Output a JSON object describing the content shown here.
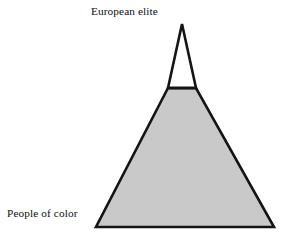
{
  "diagram": {
    "background_color": "#ffffff",
    "stroke_color": "#141414",
    "labels": {
      "top": "European elite",
      "bottom": "People of color"
    },
    "segments": [
      {
        "name": "european-elite-apex",
        "label": "European elite",
        "fill_color": "#ffffff",
        "shape": "triangle",
        "position": "top"
      },
      {
        "name": "people-of-color-base",
        "label": "People of color",
        "fill_color": "#c9c9c9",
        "shape": "trapezoid",
        "position": "bottom"
      }
    ],
    "geometry": {
      "apex": [
        182,
        24
      ],
      "divider_left": [
        168,
        88
      ],
      "divider_right": [
        196,
        88
      ],
      "base_left": [
        96,
        227
      ],
      "base_right": [
        274,
        227
      ],
      "stroke_width": 2.6
    }
  }
}
